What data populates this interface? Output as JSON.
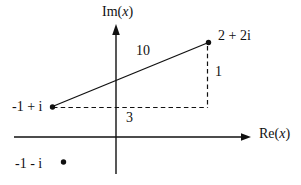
{
  "figure": {
    "background_color": "#ffffff",
    "ink_color": "#111111",
    "axes": {
      "imaginary_label": {
        "prefix": "Im(",
        "variable": "x",
        "suffix": ")"
      },
      "real_label": {
        "prefix": "Re(",
        "variable": "x",
        "suffix": ")"
      }
    },
    "points": {
      "two_plus_two_i": {
        "label": "2 + 2i"
      },
      "neg_one_plus_i": {
        "label": "-1 + i"
      },
      "neg_one_minus_i": {
        "label": "-1 - i"
      }
    },
    "measurements": {
      "hypotenuse": "10",
      "horizontal_leg": "3",
      "vertical_leg": "1"
    }
  }
}
